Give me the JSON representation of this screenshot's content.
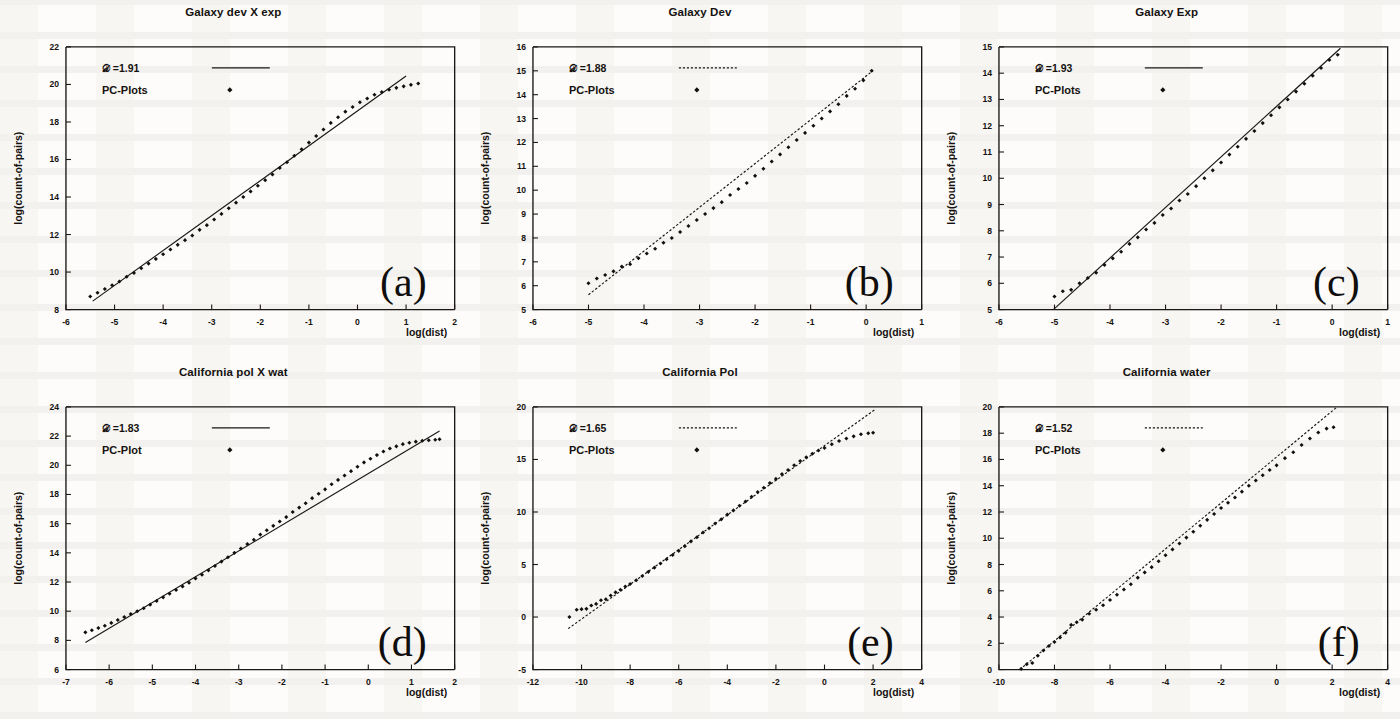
{
  "figure": {
    "axis_labels": {
      "x": "log(dist)",
      "y": "log(count-of-pairs)"
    },
    "dimension_symbol": "D",
    "legend_series_line": "fit-line",
    "legend_series_points": "PC-Plots"
  },
  "panels": [
    {
      "letter": "(a)",
      "title": "Galaxy dev X exp",
      "dimension_label": "=1.91",
      "dimension_value": 1.91,
      "points_legend_label": "PC-Plots",
      "line_style": "solid",
      "xlabel": "log(dist)",
      "ylabel": "log(count-of-pairs)",
      "xlim": [
        -6,
        2
      ],
      "ylim": [
        8,
        22
      ],
      "xticks": [
        -6,
        -5,
        -4,
        -3,
        -2,
        -1,
        0,
        1,
        2
      ],
      "yticks": [
        8,
        10,
        12,
        14,
        16,
        18,
        20,
        22
      ],
      "chart_data": {
        "type": "scatter",
        "title": "Galaxy dev X exp",
        "xlabel": "log(dist)",
        "ylabel": "log(count-of-pairs)",
        "xlim": [
          -6,
          2
        ],
        "ylim": [
          8,
          22
        ],
        "grid": false,
        "legend_position": "top-left",
        "series": [
          {
            "name": "PC-Plots",
            "type": "scatter",
            "x": [
              -5.5,
              -5.35,
              -5.2,
              -5.05,
              -4.9,
              -4.75,
              -4.6,
              -4.45,
              -4.3,
              -4.15,
              -4.0,
              -3.85,
              -3.7,
              -3.55,
              -3.4,
              -3.25,
              -3.1,
              -2.95,
              -2.8,
              -2.65,
              -2.5,
              -2.35,
              -2.2,
              -2.05,
              -1.9,
              -1.75,
              -1.6,
              -1.45,
              -1.3,
              -1.15,
              -1.0,
              -0.85,
              -0.7,
              -0.55,
              -0.4,
              -0.25,
              -0.1,
              0.05,
              0.2,
              0.35,
              0.5,
              0.65,
              0.8,
              0.95,
              1.1,
              1.25
            ],
            "y": [
              8.7,
              8.9,
              9.1,
              9.3,
              9.5,
              9.75,
              9.95,
              10.2,
              10.45,
              10.7,
              10.95,
              11.2,
              11.45,
              11.7,
              11.95,
              12.25,
              12.5,
              12.8,
              13.1,
              13.4,
              13.7,
              14.0,
              14.3,
              14.6,
              14.9,
              15.2,
              15.55,
              15.85,
              16.2,
              16.55,
              16.9,
              17.25,
              17.6,
              17.95,
              18.25,
              18.55,
              18.8,
              19.05,
              19.25,
              19.45,
              19.6,
              19.72,
              19.82,
              19.9,
              19.98,
              20.05
            ]
          },
          {
            "name": "fit-line",
            "type": "line",
            "slope": 1.91,
            "x": [
              -5.45,
              1.0
            ],
            "y": [
              8.45,
              20.45
            ]
          }
        ]
      }
    },
    {
      "letter": "(b)",
      "title": "Galaxy Dev",
      "dimension_label": "=1.88",
      "dimension_value": 1.88,
      "points_legend_label": "PC-Plots",
      "line_style": "dashed",
      "xlabel": "log(dist)",
      "ylabel": "log(count-of-pairs)",
      "xlim": [
        -6,
        1
      ],
      "ylim": [
        5,
        16
      ],
      "xticks": [
        -6,
        -5,
        -4,
        -3,
        -2,
        -1,
        0,
        1
      ],
      "yticks": [
        5,
        6,
        7,
        8,
        9,
        10,
        11,
        12,
        13,
        14,
        15,
        16
      ],
      "chart_data": {
        "type": "scatter",
        "title": "Galaxy Dev",
        "xlabel": "log(dist)",
        "ylabel": "log(count-of-pairs)",
        "xlim": [
          -6,
          1
        ],
        "ylim": [
          5,
          16
        ],
        "grid": false,
        "legend_position": "top-left",
        "series": [
          {
            "name": "PC-Plots",
            "type": "scatter",
            "x": [
              -5.0,
              -4.85,
              -4.7,
              -4.55,
              -4.4,
              -4.25,
              -4.1,
              -3.95,
              -3.8,
              -3.65,
              -3.5,
              -3.35,
              -3.2,
              -3.05,
              -2.9,
              -2.75,
              -2.6,
              -2.45,
              -2.3,
              -2.15,
              -2.0,
              -1.85,
              -1.7,
              -1.55,
              -1.4,
              -1.25,
              -1.1,
              -0.95,
              -0.8,
              -0.65,
              -0.5,
              -0.35,
              -0.2,
              -0.05,
              0.1
            ],
            "y": [
              6.1,
              6.3,
              6.45,
              6.6,
              6.8,
              6.9,
              7.15,
              7.35,
              7.55,
              7.8,
              8.0,
              8.25,
              8.5,
              8.75,
              9.0,
              9.25,
              9.5,
              9.8,
              10.05,
              10.3,
              10.6,
              10.9,
              11.2,
              11.5,
              11.8,
              12.1,
              12.4,
              12.7,
              13.0,
              13.3,
              13.6,
              13.95,
              14.25,
              14.6,
              15.0
            ]
          },
          {
            "name": "fit-line",
            "type": "line",
            "slope": 1.88,
            "x": [
              -5.0,
              0.12
            ],
            "y": [
              5.62,
              15.0
            ]
          }
        ]
      }
    },
    {
      "letter": "(c)",
      "title": "Galaxy Exp",
      "dimension_label": "=1.93",
      "dimension_value": 1.93,
      "points_legend_label": "PC-Plots",
      "line_style": "solid",
      "xlabel": "log(dist)",
      "ylabel": "log(count-of-pairs)",
      "xlim": [
        -6,
        1
      ],
      "ylim": [
        5,
        15
      ],
      "xticks": [
        -6,
        -5,
        -4,
        -3,
        -2,
        -1,
        0,
        1
      ],
      "yticks": [
        5,
        6,
        7,
        8,
        9,
        10,
        11,
        12,
        13,
        14,
        15
      ],
      "chart_data": {
        "type": "scatter",
        "title": "Galaxy Exp",
        "xlabel": "log(dist)",
        "ylabel": "log(count-of-pairs)",
        "xlim": [
          -6,
          1
        ],
        "ylim": [
          5,
          15
        ],
        "grid": false,
        "legend_position": "top-left",
        "series": [
          {
            "name": "PC-Plots",
            "type": "scatter",
            "x": [
              -5.0,
              -4.85,
              -4.7,
              -4.55,
              -4.4,
              -4.25,
              -4.1,
              -3.95,
              -3.8,
              -3.65,
              -3.5,
              -3.35,
              -3.2,
              -3.05,
              -2.9,
              -2.75,
              -2.6,
              -2.45,
              -2.3,
              -2.15,
              -2.0,
              -1.85,
              -1.7,
              -1.55,
              -1.4,
              -1.25,
              -1.1,
              -0.95,
              -0.8,
              -0.65,
              -0.5,
              -0.35,
              -0.2,
              -0.05,
              0.1
            ],
            "y": [
              5.5,
              5.7,
              5.75,
              6.0,
              6.2,
              6.4,
              6.7,
              6.95,
              7.2,
              7.5,
              7.75,
              8.05,
              8.3,
              8.6,
              8.85,
              9.15,
              9.4,
              9.7,
              10.0,
              10.3,
              10.6,
              10.9,
              11.2,
              11.5,
              11.8,
              12.1,
              12.4,
              12.7,
              13.0,
              13.3,
              13.6,
              13.9,
              14.2,
              14.5,
              14.7
            ]
          },
          {
            "name": "fit-line",
            "type": "line",
            "slope": 1.93,
            "x": [
              -5.02,
              0.15
            ],
            "y": [
              5.0,
              14.95
            ]
          }
        ]
      }
    },
    {
      "letter": "(d)",
      "title": "California pol X wat",
      "dimension_label": "=1.83",
      "dimension_value": 1.83,
      "points_legend_label": "PC-Plot",
      "line_style": "solid",
      "xlabel": "log(dist)",
      "ylabel": "log(count-of-pairs)",
      "xlim": [
        -7,
        2
      ],
      "ylim": [
        6,
        24
      ],
      "xticks": [
        -7,
        -6,
        -5,
        -4,
        -3,
        -2,
        -1,
        0,
        1,
        2
      ],
      "yticks": [
        6,
        8,
        10,
        12,
        14,
        16,
        18,
        20,
        22,
        24
      ],
      "chart_data": {
        "type": "scatter",
        "title": "California pol X wat",
        "xlabel": "log(dist)",
        "ylabel": "log(count-of-pairs)",
        "xlim": [
          -7,
          2
        ],
        "ylim": [
          6,
          24
        ],
        "grid": false,
        "legend_position": "top-left",
        "series": [
          {
            "name": "PC-Plot",
            "type": "scatter",
            "x": [
              -6.55,
              -6.4,
              -6.25,
              -6.1,
              -5.95,
              -5.8,
              -5.65,
              -5.5,
              -5.35,
              -5.2,
              -5.05,
              -4.9,
              -4.75,
              -4.6,
              -4.45,
              -4.3,
              -4.15,
              -4.0,
              -3.85,
              -3.7,
              -3.55,
              -3.4,
              -3.25,
              -3.1,
              -2.95,
              -2.8,
              -2.65,
              -2.5,
              -2.35,
              -2.2,
              -2.05,
              -1.9,
              -1.75,
              -1.6,
              -1.45,
              -1.3,
              -1.15,
              -1.0,
              -0.85,
              -0.7,
              -0.55,
              -0.4,
              -0.25,
              -0.1,
              0.05,
              0.2,
              0.35,
              0.5,
              0.65,
              0.8,
              0.95,
              1.1,
              1.25,
              1.4,
              1.55,
              1.65
            ],
            "y": [
              8.55,
              8.7,
              8.85,
              9.0,
              9.2,
              9.4,
              9.6,
              9.8,
              10.0,
              10.2,
              10.45,
              10.7,
              10.95,
              11.2,
              11.45,
              11.7,
              11.95,
              12.25,
              12.5,
              12.8,
              13.1,
              13.4,
              13.7,
              14.0,
              14.3,
              14.6,
              14.9,
              15.25,
              15.55,
              15.85,
              16.15,
              16.45,
              16.8,
              17.1,
              17.4,
              17.75,
              18.05,
              18.35,
              18.7,
              19.0,
              19.3,
              19.6,
              19.9,
              20.2,
              20.45,
              20.7,
              20.95,
              21.15,
              21.3,
              21.45,
              21.55,
              21.62,
              21.68,
              21.72,
              21.75,
              21.78
            ]
          },
          {
            "name": "fit-line",
            "type": "line",
            "slope": 1.83,
            "x": [
              -6.55,
              1.65
            ],
            "y": [
              7.85,
              22.35
            ]
          }
        ]
      }
    },
    {
      "letter": "(e)",
      "title": "California Pol",
      "dimension_label": "=1.65",
      "dimension_value": 1.65,
      "points_legend_label": "PC-Plots",
      "line_style": "dashed",
      "xlabel": "log(dist)",
      "ylabel": "log(count-of-pairs)",
      "xlim": [
        -12,
        4
      ],
      "ylim": [
        -5,
        20
      ],
      "xticks": [
        -12,
        -10,
        -8,
        -6,
        -4,
        -2,
        0,
        2,
        4
      ],
      "yticks": [
        -5,
        0,
        5,
        10,
        15,
        20
      ],
      "chart_data": {
        "type": "scatter",
        "title": "California Pol",
        "xlabel": "log(dist)",
        "ylabel": "log(count-of-pairs)",
        "xlim": [
          -12,
          4
        ],
        "ylim": [
          -5,
          20
        ],
        "grid": false,
        "legend_position": "top-left",
        "series": [
          {
            "name": "PC-Plots",
            "type": "scatter",
            "x": [
              -10.5,
              -10.2,
              -10.0,
              -9.8,
              -9.6,
              -9.4,
              -9.2,
              -9.0,
              -8.8,
              -8.6,
              -8.4,
              -8.2,
              -8.0,
              -7.75,
              -7.5,
              -7.25,
              -7.0,
              -6.75,
              -6.5,
              -6.25,
              -6.0,
              -5.75,
              -5.5,
              -5.25,
              -5.0,
              -4.75,
              -4.5,
              -4.25,
              -4.0,
              -3.75,
              -3.5,
              -3.25,
              -3.0,
              -2.75,
              -2.5,
              -2.25,
              -2.0,
              -1.75,
              -1.5,
              -1.25,
              -1.0,
              -0.75,
              -0.5,
              -0.25,
              0.0,
              0.3,
              0.6,
              0.9,
              1.2,
              1.5,
              1.8,
              2.0
            ],
            "y": [
              0.0,
              0.7,
              0.75,
              0.78,
              1.1,
              1.25,
              1.6,
              1.7,
              2.05,
              2.35,
              2.6,
              2.9,
              3.15,
              3.5,
              3.9,
              4.3,
              4.7,
              5.1,
              5.5,
              5.9,
              6.3,
              6.75,
              7.2,
              7.6,
              8.05,
              8.45,
              8.9,
              9.3,
              9.75,
              10.15,
              10.6,
              11.0,
              11.45,
              11.9,
              12.3,
              12.75,
              13.15,
              13.6,
              14.0,
              14.45,
              14.85,
              15.2,
              15.55,
              15.85,
              16.1,
              16.45,
              16.75,
              17.0,
              17.2,
              17.4,
              17.5,
              17.55
            ]
          },
          {
            "name": "fit-line",
            "type": "line",
            "slope": 1.65,
            "x": [
              -10.55,
              2.05
            ],
            "y": [
              -1.1,
              19.7
            ]
          }
        ]
      }
    },
    {
      "letter": "(f)",
      "title": "California water",
      "dimension_label": "=1.52",
      "dimension_value": 1.52,
      "points_legend_label": "PC-Plots",
      "line_style": "dashed",
      "xlabel": "log(dist)",
      "ylabel": "log(count-of-pairs)",
      "xlim": [
        -10,
        4
      ],
      "ylim": [
        0,
        20
      ],
      "xticks": [
        -10,
        -8,
        -6,
        -4,
        -2,
        0,
        2,
        4
      ],
      "yticks": [
        0,
        2,
        4,
        6,
        8,
        10,
        12,
        14,
        16,
        18,
        20
      ],
      "chart_data": {
        "type": "scatter",
        "title": "California water",
        "xlabel": "log(dist)",
        "ylabel": "log(count-of-pairs)",
        "xlim": [
          -10,
          4
        ],
        "ylim": [
          0,
          20
        ],
        "grid": false,
        "legend_position": "top-left",
        "series": [
          {
            "name": "PC-Plots",
            "type": "scatter",
            "x": [
              -9.2,
              -9.0,
              -8.8,
              -8.6,
              -8.4,
              -8.2,
              -8.0,
              -7.8,
              -7.6,
              -7.4,
              -7.2,
              -7.0,
              -6.75,
              -6.5,
              -6.25,
              -6.0,
              -5.75,
              -5.5,
              -5.25,
              -5.0,
              -4.75,
              -4.5,
              -4.25,
              -4.0,
              -3.75,
              -3.5,
              -3.25,
              -3.0,
              -2.75,
              -2.5,
              -2.25,
              -2.0,
              -1.75,
              -1.5,
              -1.25,
              -1.0,
              -0.75,
              -0.5,
              -0.25,
              0.0,
              0.3,
              0.6,
              0.9,
              1.2,
              1.5,
              1.8,
              2.05
            ],
            "y": [
              0.05,
              0.4,
              0.5,
              1.05,
              1.45,
              1.8,
              2.1,
              2.45,
              2.8,
              3.4,
              3.6,
              3.8,
              4.25,
              4.55,
              4.9,
              5.3,
              5.7,
              6.1,
              6.5,
              7.0,
              7.4,
              7.8,
              8.25,
              8.7,
              9.15,
              9.6,
              10.05,
              10.5,
              10.95,
              11.4,
              11.85,
              12.3,
              12.7,
              13.1,
              13.55,
              14.0,
              14.4,
              14.8,
              15.2,
              15.55,
              16.1,
              16.55,
              17.1,
              17.6,
              18.05,
              18.35,
              18.45
            ]
          },
          {
            "name": "fit-line",
            "type": "line",
            "slope": 1.52,
            "x": [
              -9.25,
              2.15
            ],
            "y": [
              0.0,
              19.95
            ]
          }
        ]
      }
    }
  ]
}
